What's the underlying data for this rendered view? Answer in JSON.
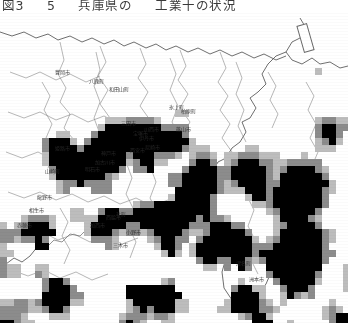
{
  "figure": {
    "caption_parts": [
      "図3",
      "5",
      "兵庫県の",
      "工業十の状況"
    ],
    "caption_full": "図3 - 5  兵庫県の  工業十の状況"
  },
  "map": {
    "type": "mesh-statistics-choropleth",
    "region_label": "兵庫県",
    "legend_box": {
      "present": true,
      "x": 300,
      "y": 12,
      "width": 9,
      "height": 26,
      "rotation_deg": -16,
      "label": ""
    },
    "colors": {
      "cell_high": "#000000",
      "cell_mid": "#8c8c8c",
      "cell_low": "#bdbdbd",
      "boundary": "#5b5b5b",
      "river": "#7a7a7a",
      "coast": "#4a4a4a",
      "background": "#ffffff"
    },
    "cell_size_px": 7,
    "place_labels": [
      {
        "text": "神戸市",
        "x": 108,
        "y": 142
      },
      {
        "text": "西宮市",
        "x": 137,
        "y": 139
      },
      {
        "text": "尼崎市",
        "x": 152,
        "y": 136
      },
      {
        "text": "明石市",
        "x": 92,
        "y": 158
      },
      {
        "text": "加古川市",
        "x": 104,
        "y": 151
      },
      {
        "text": "姫路市",
        "x": 62,
        "y": 137
      },
      {
        "text": "伊丹市",
        "x": 146,
        "y": 127
      },
      {
        "text": "宝塚市",
        "x": 140,
        "y": 122
      },
      {
        "text": "川西市",
        "x": 151,
        "y": 118
      },
      {
        "text": "三田市",
        "x": 128,
        "y": 112
      },
      {
        "text": "小野市",
        "x": 133,
        "y": 221
      },
      {
        "text": "三木市",
        "x": 120,
        "y": 234
      },
      {
        "text": "西脇市",
        "x": 113,
        "y": 206
      },
      {
        "text": "加西市",
        "x": 97,
        "y": 214
      },
      {
        "text": "龍野市",
        "x": 44,
        "y": 186
      },
      {
        "text": "相生市",
        "x": 36,
        "y": 199
      },
      {
        "text": "赤穂市",
        "x": 24,
        "y": 214
      },
      {
        "text": "豊岡市",
        "x": 62,
        "y": 61
      },
      {
        "text": "篠山市",
        "x": 183,
        "y": 118
      },
      {
        "text": "柏原町",
        "x": 188,
        "y": 100
      },
      {
        "text": "氷上町",
        "x": 176,
        "y": 96
      },
      {
        "text": "八鹿町",
        "x": 96,
        "y": 70
      },
      {
        "text": "和田山町",
        "x": 118,
        "y": 78
      },
      {
        "text": "山崎町",
        "x": 52,
        "y": 160
      },
      {
        "text": "社町",
        "x": 121,
        "y": 203
      },
      {
        "text": "洲本市",
        "x": 256,
        "y": 268
      },
      {
        "text": "津名町",
        "x": 243,
        "y": 252
      }
    ]
  },
  "mesh_data": {
    "description": "Mesh cells classified into three ink densities; each entry is [x, y, class] where class 0=low(#bdbdbd), 1=mid(#8c8c8c), 2=high(#000000).",
    "classes": [
      "low",
      "mid",
      "high"
    ],
    "counts": {
      "low": 118,
      "mid": 141,
      "high": 430
    }
  }
}
